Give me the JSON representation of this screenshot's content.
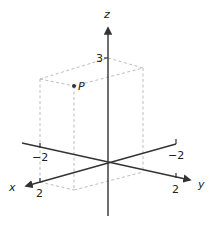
{
  "diagram": {
    "type": "3d-coordinate-axes",
    "axes": {
      "x": {
        "label": "x",
        "ticks": [
          {
            "value": "2"
          },
          {
            "value": "−2"
          }
        ]
      },
      "y": {
        "label": "y",
        "ticks": [
          {
            "value": "−2"
          },
          {
            "value": "2"
          }
        ]
      },
      "z": {
        "label": "z",
        "ticks": [
          {
            "value": "3"
          }
        ]
      }
    },
    "point": {
      "label": "P"
    },
    "colors": {
      "axis": "#333333",
      "dashed_box": "#b0b0b0",
      "point": "#333333"
    }
  }
}
